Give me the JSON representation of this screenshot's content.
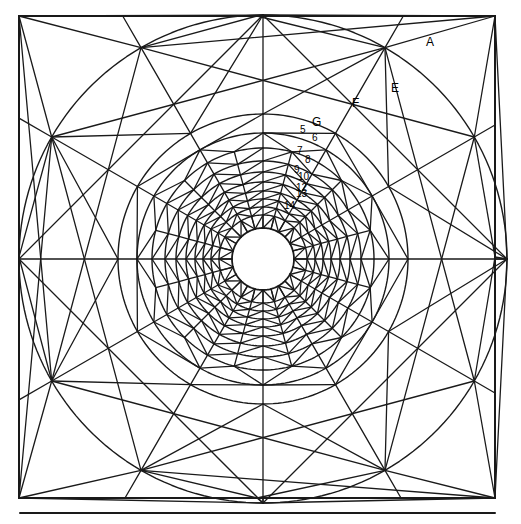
{
  "figure": {
    "background_color": "#ffffff",
    "line_color": "#1a1a1a"
  },
  "canvas": {
    "width": 521,
    "height": 524
  },
  "square": {
    "x": 19,
    "y": 16,
    "width": 476,
    "height": 482,
    "stroke_width": 2
  },
  "baseline": {
    "x1": 20,
    "y1": 513,
    "x2": 495,
    "y2": 513,
    "stroke_width": 2
  },
  "center": {
    "cx": 263,
    "cy": 259
  },
  "hole": {
    "radius": 31
  },
  "rings": [
    {
      "id": "R1",
      "radius": 31,
      "sectors": 24,
      "label": ""
    },
    {
      "id": "R2",
      "radius": 44,
      "sectors": 24,
      "label": "14"
    },
    {
      "id": "R3",
      "radius": 52,
      "sectors": 24,
      "label": "13"
    },
    {
      "id": "R4",
      "radius": 60,
      "sectors": 24,
      "label": "12"
    },
    {
      "id": "R5",
      "radius": 68,
      "sectors": 24,
      "label": "11"
    },
    {
      "id": "R6",
      "radius": 77,
      "sectors": 24,
      "label": "10"
    },
    {
      "id": "R7",
      "radius": 87,
      "sectors": 24,
      "label": "9"
    },
    {
      "id": "R8",
      "radius": 98,
      "sectors": 24,
      "label": "8"
    },
    {
      "id": "R9",
      "radius": 111,
      "sectors": 24,
      "label": "7"
    },
    {
      "id": "R10",
      "radius": 126,
      "sectors": 12,
      "label": "6"
    },
    {
      "id": "R11",
      "radius": 145,
      "sectors": 12,
      "label": "5"
    },
    {
      "id": "R12",
      "radius": 244,
      "sectors": 12,
      "label": ""
    }
  ],
  "labels": [
    {
      "name": "region-label-a",
      "text": "A",
      "x": 426,
      "y": 36,
      "kind": "letter"
    },
    {
      "name": "region-label-e",
      "text": "E",
      "x": 391,
      "y": 82,
      "kind": "letter"
    },
    {
      "name": "region-label-f",
      "text": "F",
      "x": 352,
      "y": 97,
      "kind": "letter"
    },
    {
      "name": "region-label-g",
      "text": "G",
      "x": 312,
      "y": 116,
      "kind": "letter"
    },
    {
      "name": "ring-label-5",
      "text": "5",
      "x": 300,
      "y": 125,
      "kind": "num"
    },
    {
      "name": "ring-label-6",
      "text": "6",
      "x": 312,
      "y": 133,
      "kind": "num"
    },
    {
      "name": "ring-label-7",
      "text": "7",
      "x": 297,
      "y": 146,
      "kind": "num"
    },
    {
      "name": "ring-label-8",
      "text": "8",
      "x": 305,
      "y": 155,
      "kind": "num"
    },
    {
      "name": "ring-label-9",
      "text": "9",
      "x": 294,
      "y": 165,
      "kind": "num"
    },
    {
      "name": "ring-label-10",
      "text": "10",
      "x": 298,
      "y": 172,
      "kind": "num"
    },
    {
      "name": "ring-label-12",
      "text": "12",
      "x": 296,
      "y": 183,
      "kind": "num"
    },
    {
      "name": "ring-label-13",
      "text": "13",
      "x": 296,
      "y": 189,
      "kind": "num"
    },
    {
      "name": "ring-label-14",
      "text": "14",
      "x": 284,
      "y": 201,
      "kind": "num"
    }
  ]
}
